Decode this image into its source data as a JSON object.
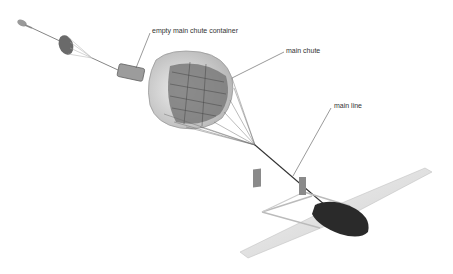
{
  "diagram": {
    "labels": {
      "container": "empty main chute container",
      "chute": "main chute",
      "line": "main line"
    },
    "components": [
      {
        "name": "pilot-chute-projectile"
      },
      {
        "name": "drogue-chute"
      },
      {
        "name": "empty-main-chute-container"
      },
      {
        "name": "main-chute"
      },
      {
        "name": "main-line"
      },
      {
        "name": "uav-aircraft"
      }
    ],
    "colors": {
      "background": "#ffffff",
      "line": "#555555",
      "canopy_outer": "#d8d8d8",
      "canopy_inner": "#7a7a7a",
      "fuselage": "#2a2a2a",
      "wing": "#e6e6e6"
    }
  }
}
